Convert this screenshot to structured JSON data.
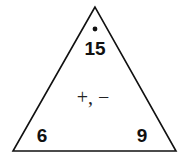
{
  "fact_triangle": {
    "top_number": "15",
    "bottom_left_number": "6",
    "bottom_right_number": "9",
    "operations": "+, −",
    "line_color": "#111111"
  }
}
